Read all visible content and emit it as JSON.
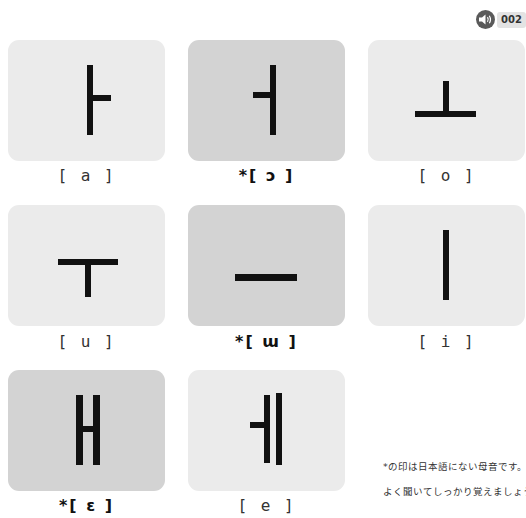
{
  "audio": {
    "icon": "speaker-icon",
    "track_number": "002"
  },
  "vowels": [
    {
      "id": "a",
      "label": "[ a ]",
      "native": true,
      "glyph": "ㅏ"
    },
    {
      "id": "o-open",
      "label": "*[ ɔ ]",
      "native": false,
      "glyph": "ㅓ"
    },
    {
      "id": "o",
      "label": "[ o ]",
      "native": true,
      "glyph": "ㅗ"
    },
    {
      "id": "u",
      "label": "[ u ]",
      "native": true,
      "glyph": "ㅜ"
    },
    {
      "id": "w",
      "label": "*[ ɯ ]",
      "native": false,
      "glyph": "ㅡ"
    },
    {
      "id": "i",
      "label": "[ i ]",
      "native": true,
      "glyph": "ㅣ"
    },
    {
      "id": "e-open",
      "label": "*[ ɛ ]",
      "native": false,
      "glyph": "ㅐ"
    },
    {
      "id": "e",
      "label": "[ e ]",
      "native": true,
      "glyph": "ㅔ"
    }
  ],
  "note": {
    "line1": "*の印は日本語にない母音です。",
    "line2": "よく聞いてしっかり覚えましょう。"
  },
  "colors": {
    "card_light": "#ebebeb",
    "card_dark": "#d3d3d3",
    "stroke": "#111111"
  }
}
